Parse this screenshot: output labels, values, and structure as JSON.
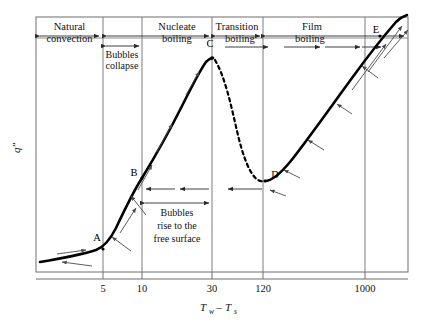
{
  "figure": {
    "axes": {
      "ylabel": "q″",
      "ylabel_plain": "q''",
      "xlabel_main": "T",
      "xlabel_sub1": "w",
      "xlabel_minus": "–",
      "xlabel_main2": "T",
      "xlabel_sub2": "s",
      "xlabel_full": "Tw – Ts",
      "xticks": [
        "5",
        "10",
        "30",
        "120",
        "1000"
      ],
      "xtick_px": [
        103,
        142,
        212,
        263,
        365
      ]
    },
    "regions": [
      {
        "id": "natural-convection",
        "line1": "Natural",
        "line2": "convection",
        "x_start": 36,
        "x_end": 103
      },
      {
        "id": "bubbles-collapse",
        "line1": "Bubbles",
        "line2": "collapse",
        "x_start": 103,
        "x_end": 142
      },
      {
        "id": "nucleate-boiling",
        "line1": "Nucleate",
        "line2": "boiling",
        "x_start": 142,
        "x_end": 212
      },
      {
        "id": "transition-boiling",
        "line1": "Transition",
        "line2": "boiling",
        "x_start": 212,
        "x_end": 263
      },
      {
        "id": "film-boiling",
        "line1": "Film",
        "line2": "boiling",
        "x_start": 263,
        "x_end": 365
      }
    ],
    "inner_annotation": {
      "id": "bubbles-rise",
      "line1": "Bubbles",
      "line2": "rise to the",
      "line3": "free surface",
      "x_start": 142,
      "x_end": 212
    },
    "points": [
      {
        "label": "A",
        "px": 103,
        "py": 248,
        "desc": "onset-of-nucleate-boiling"
      },
      {
        "label": "B",
        "px": 142,
        "py": 178,
        "desc": "fully-developed-nucleate-boiling"
      },
      {
        "label": "C",
        "px": 212,
        "py": 58,
        "desc": "critical-heat-flux-peak"
      },
      {
        "label": "D",
        "px": 265,
        "py": 181,
        "desc": "leidenfrost-minimum"
      },
      {
        "label": "E",
        "px": 378,
        "py": 48,
        "desc": "film-boiling-radiation"
      }
    ],
    "curve_data": {
      "type": "line",
      "description": "Boiling curve: heat flux q'' versus wall superheat Tw - Ts on a logarithmic temperature axis",
      "solid_segment_1": "M40,262 C58,259 80,255 96,250 C104,247 110,240 116,228 C124,211 133,192 142,178 C156,155 170,130 182,106 C192,86 200,70 206,62 C209,59 211,58 213,58",
      "solid_segment_2": "M213,58 C216,58 218,60 220,64",
      "dashed_segment": "M216,60 C226,76 232,104 238,130 C244,156 250,174 258,180 C261,182 263,181 265,181",
      "solid_segment_3": "M265,181 C272,181 280,174 290,162 C306,142 330,108 352,78 C368,56 382,38 396,22 C400,18 404,16 407,15"
    },
    "colors": {
      "curve": "#000000",
      "frame": "#6f6f6f",
      "gridline": "#7d7d7d",
      "annotation_arrow": "#4a4a4a",
      "text": "#111111",
      "background": "#ffffff"
    }
  }
}
